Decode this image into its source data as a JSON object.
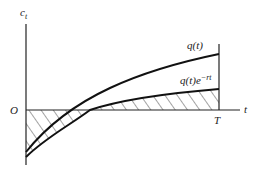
{
  "diagram": {
    "y_axis_label": "c",
    "y_axis_subscript": "t",
    "x_axis_label": "t",
    "origin_label": "O",
    "end_label": "T",
    "curves": [
      {
        "name": "q(t)",
        "label": "q(t)"
      },
      {
        "name": "discounted",
        "label_base": "q(t)e",
        "label_exp": "−rt"
      }
    ],
    "colors": {
      "ink": "#222222",
      "background": "#ffffff"
    }
  }
}
